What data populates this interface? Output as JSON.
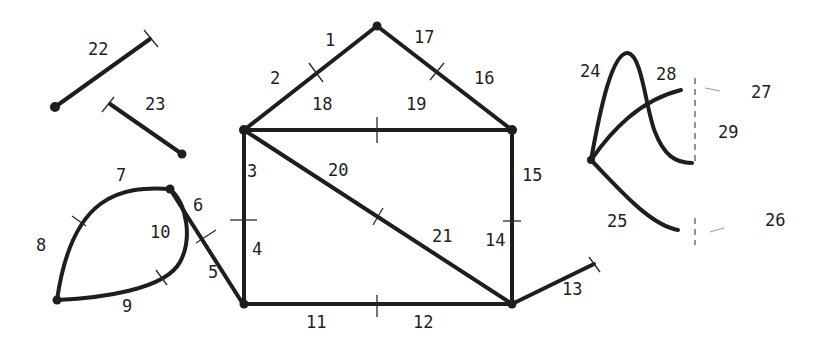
{
  "diagram": {
    "edge_labels": {
      "e1": "1",
      "e2": "2",
      "e3": "3",
      "e4": "4",
      "e5": "5",
      "e6": "6",
      "e7": "7",
      "e8": "8",
      "e9": "9",
      "e10": "10",
      "e11": "11",
      "e12": "12",
      "e13": "13",
      "e14": "14",
      "e15": "15",
      "e16": "16",
      "e17": "17",
      "e18": "18",
      "e19": "19",
      "e20": "20",
      "e21": "21",
      "e22": "22",
      "e23": "23",
      "e24": "24",
      "e25": "25",
      "e26": "26",
      "e27": "27",
      "e28": "28",
      "e29": "29"
    },
    "colors": {
      "ink": "#1e1e1e",
      "background": "#ffffff"
    }
  }
}
